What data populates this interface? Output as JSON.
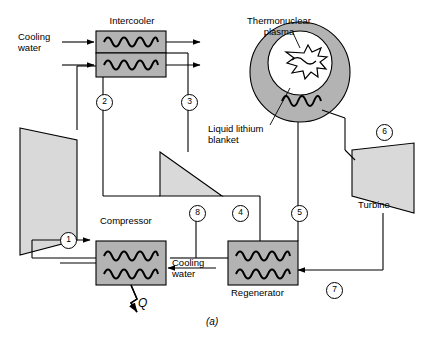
{
  "figure": {
    "caption": "(a)",
    "colors": {
      "fill_gray": "#b3b3b3",
      "fill_light": "#d9d9d9",
      "line": "#000000",
      "background": "#ffffff"
    }
  },
  "labels": {
    "intercooler": "Intercooler",
    "cooling_water_top": "Cooling\nwater",
    "thermonuclear_plasma": "Thermonuclear\nplasma",
    "liquid_lithium_blanket": "Liquid lithium\nblanket",
    "compressor": "Compressor",
    "turbine": "Turbine",
    "regenerator": "Regenerator",
    "cooling_water_bottom": "Cooling\nwater",
    "heat_out": "Q"
  },
  "state_points": [
    {
      "id": "1",
      "label": "1"
    },
    {
      "id": "2",
      "label": "2"
    },
    {
      "id": "3",
      "label": "3"
    },
    {
      "id": "4",
      "label": "4"
    },
    {
      "id": "5",
      "label": "5"
    },
    {
      "id": "6",
      "label": "6"
    },
    {
      "id": "7",
      "label": "7"
    },
    {
      "id": "8",
      "label": "8"
    }
  ]
}
